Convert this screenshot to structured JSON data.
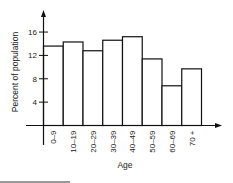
{
  "chart_data": {
    "type": "bar",
    "title": "",
    "xlabel": "Age",
    "ylabel": "Percent of population",
    "categories": [
      "0-9",
      "10-19",
      "20-29",
      "30-39",
      "40-49",
      "50-59",
      "60-69",
      "70 +"
    ],
    "values": [
      13.6,
      14.3,
      12.8,
      14.6,
      15.2,
      11.4,
      6.8,
      9.7
    ],
    "yticks": [
      "4",
      "8",
      "12",
      "16"
    ],
    "ylim": [
      0,
      18
    ],
    "grid": false,
    "legend": null
  }
}
